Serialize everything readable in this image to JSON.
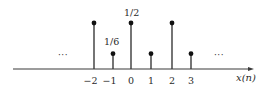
{
  "chart_data": {
    "type": "stem",
    "title": "",
    "xlabel": "x(n)",
    "ylabel": "",
    "x": [
      -2,
      -1,
      0,
      1,
      2,
      3
    ],
    "values": [
      0.5,
      0.1667,
      0.5,
      0.1667,
      0.5,
      0.1667
    ],
    "tick_labels": [
      "−2",
      "−1",
      "0",
      "1",
      "2",
      "3"
    ],
    "annotations": [
      {
        "x": 0,
        "text": "1/2"
      },
      {
        "x": -1,
        "text": "1/6"
      }
    ],
    "continuation_left": "···",
    "continuation_right": "···",
    "grid": false,
    "legend": null,
    "colors": {
      "stem": "#3a3a3a",
      "axis": "#3a3a3a",
      "text": "#2a2a2a"
    }
  },
  "layout": {
    "axis_y": 69,
    "axis_x_start": 13,
    "axis_x_end": 254,
    "stem_x": [
      94,
      113,
      131,
      151,
      172,
      191
    ],
    "top_y": 23,
    "short_y": 52
  }
}
